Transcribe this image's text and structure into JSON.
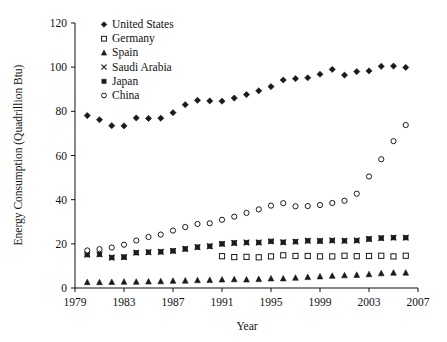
{
  "chart_data": {
    "type": "scatter",
    "title": "",
    "xlabel": "Year",
    "ylabel": "Energy Consumption (Quadrillion Btu)",
    "xlim": [
      1979,
      2007
    ],
    "ylim": [
      0,
      120
    ],
    "xticks": [
      1979,
      1983,
      1987,
      1991,
      1995,
      1999,
      2003,
      2007
    ],
    "yticks": [
      0,
      20,
      40,
      60,
      80,
      100,
      120
    ],
    "grid": false,
    "legend_position": "top-left-inside",
    "series": [
      {
        "name": "United States",
        "marker": "filled-diamond",
        "x": [
          1980,
          1981,
          1982,
          1983,
          1984,
          1985,
          1986,
          1987,
          1988,
          1989,
          1990,
          1991,
          1992,
          1993,
          1994,
          1995,
          1996,
          1997,
          1998,
          1999,
          2000,
          2001,
          2002,
          2003,
          2004,
          2005,
          2006
        ],
        "values": [
          78.1,
          76.2,
          73.5,
          73.4,
          77.0,
          76.8,
          76.9,
          79.4,
          83.0,
          85.0,
          84.7,
          84.6,
          86.0,
          87.6,
          89.3,
          91.2,
          94.2,
          94.8,
          95.2,
          96.8,
          99.0,
          96.4,
          98.0,
          98.3,
          100.4,
          100.5,
          99.9
        ]
      },
      {
        "name": "Germany",
        "marker": "open-square",
        "x": [
          1991,
          1992,
          1993,
          1994,
          1995,
          1996,
          1997,
          1998,
          1999,
          2000,
          2001,
          2002,
          2003,
          2004,
          2005,
          2006
        ],
        "values": [
          14.4,
          14.0,
          14.1,
          13.9,
          14.3,
          14.8,
          14.5,
          14.5,
          14.3,
          14.3,
          14.6,
          14.4,
          14.5,
          14.6,
          14.3,
          14.6
        ]
      },
      {
        "name": "Spain",
        "marker": "filled-triangle",
        "x": [
          1980,
          1981,
          1982,
          1983,
          1984,
          1985,
          1986,
          1987,
          1988,
          1989,
          1990,
          1991,
          1992,
          1993,
          1994,
          1995,
          1996,
          1997,
          1998,
          1999,
          2000,
          2001,
          2002,
          2003,
          2004,
          2005,
          2006
        ],
        "values": [
          2.6,
          2.6,
          2.7,
          2.8,
          2.8,
          2.9,
          3.0,
          3.2,
          3.3,
          3.5,
          3.6,
          3.8,
          3.9,
          3.8,
          4.0,
          4.3,
          4.3,
          4.6,
          4.9,
          5.2,
          5.5,
          5.7,
          5.9,
          6.2,
          6.6,
          6.9,
          6.9
        ]
      },
      {
        "name": "Saudi Arabia",
        "marker": "cross-x",
        "x": [
          1980,
          1981,
          1982,
          1983,
          1984,
          1985,
          1986,
          1987,
          1988,
          1989,
          1990,
          1991,
          1992,
          1993,
          1994,
          1995,
          1996,
          1997,
          1998,
          1999,
          2000,
          2001,
          2002,
          2003,
          2004,
          2005,
          2006
        ],
        "values": [
          15.1,
          15.2,
          13.8,
          14.0,
          16.0,
          16.2,
          16.4,
          16.8,
          17.7,
          18.5,
          18.9,
          20.0,
          20.4,
          20.6,
          20.6,
          21.1,
          20.7,
          21.0,
          21.4,
          21.3,
          21.5,
          21.4,
          21.5,
          22.2,
          22.6,
          22.8,
          22.8
        ]
      },
      {
        "name": "Japan",
        "marker": "filled-square",
        "x": [
          1980,
          1981,
          1982,
          1983,
          1984,
          1985,
          1986,
          1987,
          1988,
          1989,
          1990,
          1991,
          1992,
          1993,
          1994,
          1995,
          1996,
          1997,
          1998,
          1999,
          2000,
          2001,
          2002,
          2003,
          2004,
          2005,
          2006
        ],
        "values": [
          15.1,
          15.2,
          13.8,
          14.0,
          16.0,
          16.2,
          16.4,
          16.8,
          17.7,
          18.5,
          18.9,
          20.0,
          20.4,
          20.6,
          20.6,
          21.1,
          20.7,
          21.0,
          21.4,
          21.3,
          21.5,
          21.4,
          21.5,
          22.2,
          22.6,
          22.8,
          22.8
        ]
      },
      {
        "name": "China",
        "marker": "open-circle",
        "x": [
          1980,
          1981,
          1982,
          1983,
          1984,
          1985,
          1986,
          1987,
          1988,
          1989,
          1990,
          1991,
          1992,
          1993,
          1994,
          1995,
          1996,
          1997,
          1998,
          1999,
          2000,
          2001,
          2002,
          2003,
          2004,
          2005,
          2006
        ],
        "values": [
          17.0,
          17.6,
          18.3,
          19.6,
          21.5,
          23.1,
          24.2,
          26.0,
          27.6,
          29.0,
          29.3,
          30.9,
          32.3,
          34.0,
          35.6,
          37.3,
          38.4,
          37.0,
          37.1,
          37.6,
          38.5,
          39.5,
          42.7,
          50.5,
          58.3,
          66.5,
          73.8
        ]
      }
    ]
  }
}
